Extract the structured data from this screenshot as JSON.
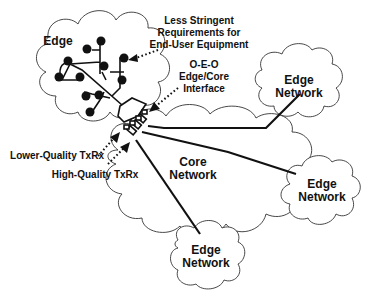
{
  "diagram": {
    "type": "network-architecture",
    "labels": {
      "edge_top": "Edge",
      "annotation_requirements": [
        "Less Stringent",
        "Requirements for",
        "End-User Equipment"
      ],
      "annotation_interface": [
        "O-E-O",
        "Edge/Core",
        "Interface"
      ],
      "edge_network_upper_right": [
        "Edge",
        "Network"
      ],
      "core_network": [
        "Core",
        "Network"
      ],
      "edge_network_right": [
        "Edge",
        "Network"
      ],
      "edge_network_bottom": [
        "Edge",
        "Network"
      ],
      "lower_quality_txrx": "Lower-Quality TxRx",
      "high_quality_txrx": "High-Quality TxRx"
    },
    "clouds": [
      "Edge",
      "Edge Network (upper right)",
      "Core Network",
      "Edge Network (right)",
      "Edge Network (bottom)"
    ],
    "colors": {
      "line": "#111111",
      "cloud_outline": "#333333",
      "background": "#ffffff"
    }
  }
}
